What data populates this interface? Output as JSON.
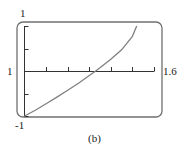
{
  "chart_data": {
    "type": "line",
    "title": "",
    "caption": "(b)",
    "xlabel": "",
    "ylabel": "",
    "xlim": [
      1,
      1.6
    ],
    "ylim": [
      -1,
      1
    ],
    "x_tick_step": 0.1,
    "y_tick_step": 0.5,
    "grid": false,
    "labels": {
      "x_min": "1",
      "x_max": "1.6",
      "y_max": "1",
      "y_min": "-1"
    },
    "series": [
      {
        "name": "f(x)",
        "x": [
          1.0,
          1.05,
          1.1,
          1.15,
          1.2,
          1.25,
          1.3,
          1.33,
          1.35,
          1.4,
          1.45,
          1.5,
          1.52
        ],
        "y": [
          -1.0,
          -0.87,
          -0.73,
          -0.58,
          -0.43,
          -0.27,
          -0.1,
          0.0,
          0.07,
          0.26,
          0.47,
          0.77,
          1.0
        ]
      }
    ],
    "colors": {
      "frame": "#6a6a6a",
      "curve": "#808080",
      "axis": "#333333"
    }
  }
}
